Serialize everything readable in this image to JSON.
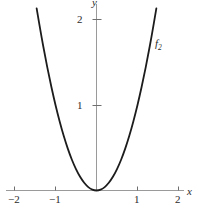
{
  "figure": {
    "name": "parabola-plot",
    "width": 199,
    "height": 211,
    "background": "#ffffff"
  },
  "axes": {
    "x_name": "x",
    "y_name": "y",
    "axis_color": "#9a9a9a",
    "tick_color": "#6f6f6f",
    "label_color": "#2b2b2b",
    "x_ticks": [
      {
        "value": -2,
        "label": "−2"
      },
      {
        "value": -1,
        "label": "−1"
      },
      {
        "value": 1,
        "label": "1"
      },
      {
        "value": 2,
        "label": "2"
      }
    ],
    "y_ticks": [
      {
        "value": 1,
        "label": "1"
      },
      {
        "value": 2,
        "label": "2"
      }
    ],
    "xlim": [
      -2.35,
      2.3
    ],
    "ylim": [
      -0.06,
      2.25
    ],
    "grid": false
  },
  "chart_data": {
    "type": "line",
    "title": "",
    "subtitle": "",
    "xlabel": "x",
    "ylabel": "y",
    "xlim": [
      -2.35,
      2.3
    ],
    "ylim": [
      -0.06,
      2.25
    ],
    "grid": false,
    "legend_position": "inline-curve-label",
    "series": [
      {
        "name": "f₂",
        "label": "f2",
        "label_display": "f",
        "label_subscript": "2",
        "color": "#1c1c1c",
        "line_width": 1.8,
        "equation": "y = x^2",
        "x": [
          -1.46,
          -1.4,
          -1.3,
          -1.2,
          -1.1,
          -1.0,
          -0.9,
          -0.8,
          -0.7,
          -0.6,
          -0.5,
          -0.4,
          -0.3,
          -0.2,
          -0.1,
          0.0,
          0.1,
          0.2,
          0.3,
          0.4,
          0.5,
          0.6,
          0.7,
          0.8,
          0.9,
          1.0,
          1.1,
          1.2,
          1.3,
          1.4,
          1.46
        ],
        "y": [
          2.13,
          1.96,
          1.69,
          1.44,
          1.21,
          1.0,
          0.81,
          0.64,
          0.49,
          0.36,
          0.25,
          0.16,
          0.09,
          0.04,
          0.01,
          0.0,
          0.01,
          0.04,
          0.09,
          0.16,
          0.25,
          0.36,
          0.49,
          0.64,
          0.81,
          1.0,
          1.21,
          1.44,
          1.69,
          1.96,
          2.13
        ]
      }
    ],
    "annotations": [
      {
        "text": "f₂",
        "x": 1.45,
        "y": 1.78,
        "name": "curve-label-f2"
      }
    ]
  },
  "labels": {
    "x_minus_2": "−2",
    "x_minus_1": "−1",
    "x_plus_1": "1",
    "x_plus_2": "2",
    "y_1": "1",
    "y_2": "2",
    "x_axis": "x",
    "y_axis": "y",
    "curve_f2_base": "f",
    "curve_f2_sub": "2"
  }
}
